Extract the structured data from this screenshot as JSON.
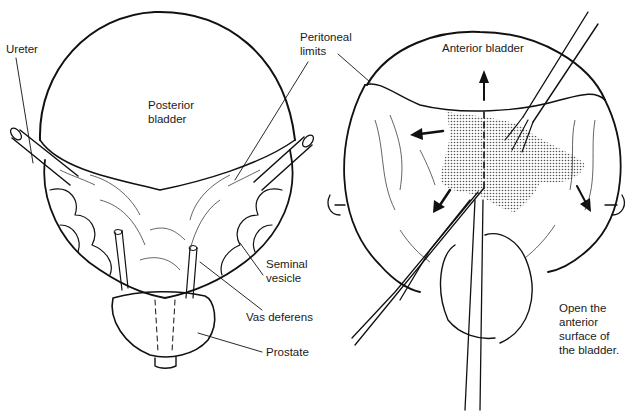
{
  "figure": {
    "left_panel": {
      "title": "Posterior view",
      "labels": {
        "ureter": "Ureter",
        "posterior_bladder": "Posterior\nbladder",
        "peritoneal_limits": "Peritoneal\nlimits",
        "seminal_vesicle": "Seminal\nvesicle",
        "vas_deferens": "Vas deferens",
        "prostate": "Prostate"
      }
    },
    "right_panel": {
      "labels": {
        "anterior_bladder": "Anterior bladder",
        "caption": "Open the\nanterior\nsurface of\nthe bladder."
      }
    },
    "colors": {
      "ink": "#111111",
      "background": "#ffffff",
      "stipple": "#555555"
    }
  }
}
